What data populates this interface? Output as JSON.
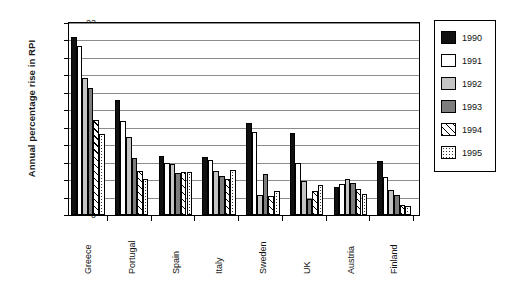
{
  "chart_data": {
    "type": "bar",
    "title": "",
    "xlabel": "",
    "ylabel": "Annual percentage rise in RPI",
    "ylim": [
      0,
      22
    ],
    "y_ticks": [
      0,
      2,
      4,
      6,
      8,
      10,
      12,
      14,
      16,
      18,
      20,
      22
    ],
    "grid": true,
    "legend_position": "right",
    "categories": [
      "Greece",
      "Portugal",
      "Spain",
      "Italy",
      "Sweden",
      "UK",
      "Austria",
      "Finland"
    ],
    "series": [
      {
        "name": "1990",
        "color": "#111111",
        "pattern": "solid-black",
        "values": [
          20.4,
          13.2,
          6.8,
          6.6,
          10.5,
          9.4,
          3.2,
          6.2
        ]
      },
      {
        "name": "1991",
        "color": "#ffffff",
        "pattern": "solid-white",
        "values": [
          19.4,
          10.8,
          6.0,
          6.3,
          9.5,
          6.0,
          3.5,
          4.3
        ]
      },
      {
        "name": "1992",
        "color": "#c4c4c4",
        "pattern": "solid-light-gray",
        "values": [
          15.7,
          8.9,
          5.9,
          5.1,
          2.3,
          3.9,
          4.1,
          2.9
        ]
      },
      {
        "name": "1993",
        "color": "#7d7d7d",
        "pattern": "solid-dark-gray",
        "values": [
          14.5,
          6.5,
          4.8,
          4.5,
          4.7,
          1.8,
          3.7,
          2.3
        ]
      },
      {
        "name": "1994",
        "color": "#ffffff",
        "pattern": "diagonal-hatch",
        "values": [
          10.9,
          5.1,
          4.9,
          4.1,
          2.2,
          2.7,
          3.0,
          1.1
        ]
      },
      {
        "name": "1995",
        "color": "#ffffff",
        "pattern": "dotted",
        "values": [
          9.3,
          4.1,
          4.9,
          5.2,
          2.7,
          3.4,
          2.4,
          1.0
        ]
      }
    ]
  },
  "legend": {
    "items": [
      {
        "label": "1990"
      },
      {
        "label": "1991"
      },
      {
        "label": "1992"
      },
      {
        "label": "1993"
      },
      {
        "label": "1994"
      },
      {
        "label": "1995"
      }
    ]
  }
}
